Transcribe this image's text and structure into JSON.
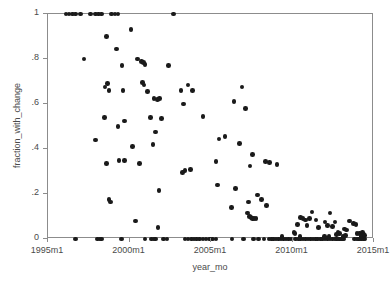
{
  "chart_data": {
    "type": "scatter",
    "title": "",
    "xlabel": "year_mo",
    "ylabel": "fraction_with_change",
    "xlim": [
      1995.0,
      2015.0
    ],
    "ylim": [
      0,
      1
    ],
    "grid": false,
    "legend": null,
    "marker": {
      "shape": "circle",
      "color": "#1a1a1a",
      "size_px": 4.6
    },
    "xtick_labels": [
      "1995m1",
      "2000m1",
      "2005m1",
      "2010m1",
      "2015m1"
    ],
    "xtick_values": [
      1995.0,
      2000.0,
      2005.0,
      2010.0,
      2015.0
    ],
    "ytick_labels": [
      "0",
      ".2",
      ".4",
      ".6",
      ".8",
      "1"
    ],
    "ytick_values": [
      0,
      0.2,
      0.4,
      0.6,
      0.8,
      1
    ],
    "x_name": "year_mo",
    "y_name": "fraction_with_change",
    "n_points": 184,
    "points": [
      [
        1996.1,
        1.0
      ],
      [
        1996.3,
        1.0
      ],
      [
        1996.5,
        1.0
      ],
      [
        1996.7,
        1.0
      ],
      [
        1997.0,
        1.0
      ],
      [
        1997.6,
        1.0
      ],
      [
        1997.9,
        1.0
      ],
      [
        1998.1,
        1.0
      ],
      [
        1998.3,
        1.0
      ],
      [
        1998.9,
        1.0
      ],
      [
        1999.1,
        1.0
      ],
      [
        1999.3,
        1.0
      ],
      [
        2002.7,
        1.0
      ],
      [
        2000.1,
        0.93
      ],
      [
        1998.6,
        0.9
      ],
      [
        1999.2,
        0.845
      ],
      [
        1997.2,
        0.8
      ],
      [
        2000.5,
        0.8
      ],
      [
        2000.75,
        0.79
      ],
      [
        2000.85,
        0.785
      ],
      [
        2000.95,
        0.775
      ],
      [
        1999.55,
        0.77
      ],
      [
        2002.4,
        0.77
      ],
      [
        1998.65,
        0.69
      ],
      [
        2000.8,
        0.695
      ],
      [
        2000.9,
        0.685
      ],
      [
        1998.5,
        0.675
      ],
      [
        2003.6,
        0.685
      ],
      [
        2006.9,
        0.675
      ],
      [
        1998.75,
        0.66
      ],
      [
        1999.6,
        0.66
      ],
      [
        2001.1,
        0.655
      ],
      [
        2003.15,
        0.66
      ],
      [
        2003.85,
        0.66
      ],
      [
        2001.5,
        0.625
      ],
      [
        2001.85,
        0.625
      ],
      [
        2001.7,
        0.62
      ],
      [
        2006.4,
        0.61
      ],
      [
        2003.3,
        0.6
      ],
      [
        2007.1,
        0.58
      ],
      [
        2004.5,
        0.545
      ],
      [
        1998.45,
        0.54
      ],
      [
        2001.3,
        0.54
      ],
      [
        2001.95,
        0.535
      ],
      [
        1999.7,
        0.525
      ],
      [
        1999.3,
        0.5
      ],
      [
        2001.6,
        0.475
      ],
      [
        2005.85,
        0.455
      ],
      [
        2005.5,
        0.445
      ],
      [
        1997.9,
        0.44
      ],
      [
        2001.45,
        0.42
      ],
      [
        2000.2,
        0.41
      ],
      [
        2006.75,
        0.425
      ],
      [
        2007.55,
        0.375
      ],
      [
        2008.35,
        0.345
      ],
      [
        2008.6,
        0.34
      ],
      [
        2009.05,
        0.33
      ],
      [
        2005.3,
        0.345
      ],
      [
        1999.35,
        0.35
      ],
      [
        1999.7,
        0.35
      ],
      [
        1998.6,
        0.335
      ],
      [
        2000.6,
        0.335
      ],
      [
        2007.4,
        0.325
      ],
      [
        2003.4,
        0.305
      ],
      [
        2003.25,
        0.295
      ],
      [
        2003.75,
        0.31
      ],
      [
        2005.4,
        0.24
      ],
      [
        2001.8,
        0.215
      ],
      [
        2006.5,
        0.225
      ],
      [
        2007.85,
        0.195
      ],
      [
        2008.1,
        0.175
      ],
      [
        1998.75,
        0.175
      ],
      [
        1998.85,
        0.165
      ],
      [
        2007.3,
        0.165
      ],
      [
        2008.4,
        0.15
      ],
      [
        2006.25,
        0.14
      ],
      [
        2011.2,
        0.12
      ],
      [
        2007.25,
        0.115
      ],
      [
        2012.3,
        0.115
      ],
      [
        2007.35,
        0.1
      ],
      [
        2007.45,
        0.095
      ],
      [
        2007.55,
        0.09
      ],
      [
        2007.65,
        0.09
      ],
      [
        2007.75,
        0.09
      ],
      [
        2010.5,
        0.095
      ],
      [
        2010.65,
        0.09
      ],
      [
        2010.8,
        0.085
      ],
      [
        2011.05,
        0.09
      ],
      [
        2011.45,
        0.085
      ],
      [
        2000.35,
        0.08
      ],
      [
        2012.0,
        0.075
      ],
      [
        2012.6,
        0.075
      ],
      [
        2013.5,
        0.08
      ],
      [
        2013.75,
        0.07
      ],
      [
        2013.9,
        0.065
      ],
      [
        2010.3,
        0.065
      ],
      [
        2010.9,
        0.06
      ],
      [
        2012.15,
        0.06
      ],
      [
        2012.45,
        0.055
      ],
      [
        2001.75,
        0.05
      ],
      [
        2011.6,
        0.05
      ],
      [
        2013.2,
        0.045
      ],
      [
        2013.3,
        0.04
      ],
      [
        2010.1,
        0.03
      ],
      [
        2010.15,
        0.025
      ],
      [
        2012.8,
        0.03
      ],
      [
        2012.9,
        0.025
      ],
      [
        2013.95,
        0.025
      ],
      [
        2014.1,
        0.025
      ],
      [
        2014.3,
        0.03
      ],
      [
        2014.35,
        0.02
      ],
      [
        2012.7,
        0.02
      ],
      [
        1996.7,
        0.0
      ],
      [
        1998.05,
        0.0
      ],
      [
        1998.2,
        0.0
      ],
      [
        1998.3,
        0.0
      ],
      [
        1999.5,
        0.0
      ],
      [
        2000.95,
        0.0
      ],
      [
        2001.35,
        0.0
      ],
      [
        2001.5,
        0.0
      ],
      [
        2001.6,
        0.0
      ],
      [
        2002.1,
        0.0
      ],
      [
        2002.3,
        0.0
      ],
      [
        2003.4,
        0.0
      ],
      [
        2003.6,
        0.0
      ],
      [
        2003.8,
        0.0
      ],
      [
        2003.95,
        0.0
      ],
      [
        2004.1,
        0.0
      ],
      [
        2004.3,
        0.0
      ],
      [
        2004.5,
        0.0
      ],
      [
        2004.7,
        0.0
      ],
      [
        2004.9,
        0.0
      ],
      [
        2005.1,
        0.0
      ],
      [
        2005.3,
        0.0
      ],
      [
        2006.3,
        0.0
      ],
      [
        2007.0,
        0.0
      ],
      [
        2007.6,
        0.0
      ],
      [
        2008.7,
        0.0
      ],
      [
        2008.85,
        0.0
      ],
      [
        2009.0,
        0.0
      ],
      [
        2009.15,
        0.0
      ],
      [
        2009.3,
        0.0
      ],
      [
        2009.45,
        0.0
      ],
      [
        2009.6,
        0.0
      ],
      [
        2009.75,
        0.0
      ],
      [
        2009.9,
        0.0
      ],
      [
        2010.2,
        0.0
      ],
      [
        2010.35,
        0.0
      ],
      [
        2010.5,
        0.0
      ],
      [
        2010.65,
        0.0
      ],
      [
        2010.8,
        0.0
      ],
      [
        2010.95,
        0.0
      ],
      [
        2011.1,
        0.0
      ],
      [
        2011.25,
        0.0
      ],
      [
        2011.4,
        0.0
      ],
      [
        2011.55,
        0.0
      ],
      [
        2011.7,
        0.0
      ],
      [
        2011.85,
        0.0
      ],
      [
        2012.0,
        0.0
      ],
      [
        2012.15,
        0.0
      ],
      [
        2012.3,
        0.0
      ],
      [
        2012.45,
        0.0
      ],
      [
        2012.6,
        0.0
      ],
      [
        2012.7,
        0.0
      ],
      [
        2012.8,
        0.0
      ],
      [
        2012.9,
        0.0
      ],
      [
        2013.0,
        0.0
      ],
      [
        2013.05,
        0.0
      ],
      [
        2013.15,
        0.0
      ],
      [
        2013.8,
        0.0
      ],
      [
        2013.95,
        0.0
      ],
      [
        2014.05,
        0.0
      ],
      [
        2014.15,
        0.0
      ],
      [
        2014.25,
        0.0
      ],
      [
        2014.35,
        0.0
      ],
      [
        2014.45,
        0.0
      ],
      [
        2008.55,
        0.0
      ],
      [
        2013.1,
        0.01
      ],
      [
        2013.25,
        0.015
      ],
      [
        2014.2,
        0.01
      ],
      [
        2014.4,
        0.015
      ],
      [
        2009.35,
        0.01
      ],
      [
        2010.45,
        0.01
      ],
      [
        2011.95,
        0.01
      ],
      [
        2012.25,
        0.01
      ],
      [
        2007.9,
        0.0
      ],
      [
        2008.25,
        0.0
      ]
    ]
  }
}
